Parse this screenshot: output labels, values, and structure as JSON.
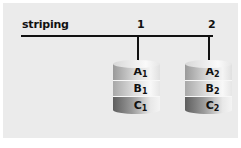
{
  "title": "striping",
  "channels": [
    {
      "label": "1",
      "disk": {
        "blocks": [
          {
            "letter": "A",
            "index": "1"
          },
          {
            "letter": "B",
            "index": "1"
          },
          {
            "letter": "C",
            "index": "1"
          }
        ]
      }
    },
    {
      "label": "2",
      "disk": {
        "blocks": [
          {
            "letter": "A",
            "index": "2"
          },
          {
            "letter": "B",
            "index": "2"
          },
          {
            "letter": "C",
            "index": "2"
          }
        ]
      }
    }
  ],
  "colors": {
    "background": "#ebebeb",
    "line": "#111111"
  }
}
